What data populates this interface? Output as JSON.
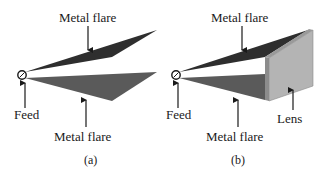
{
  "figure_a": {
    "caption": "(a)",
    "labels": {
      "top_flare": "Metal flare",
      "feed": "Feed",
      "bottom_flare": "Metal flare"
    }
  },
  "figure_b": {
    "caption": "(b)",
    "labels": {
      "top_flare": "Metal flare",
      "feed": "Feed",
      "bottom_flare": "Metal flare",
      "lens": "Lens"
    }
  },
  "colors": {
    "top_flare": "#2e2e2e",
    "bottom_flare": "#5a5a5a",
    "lens_face": "#b4b4b4",
    "lens_edge": "#8c8c8c",
    "arrow": "#1a1a1a"
  }
}
